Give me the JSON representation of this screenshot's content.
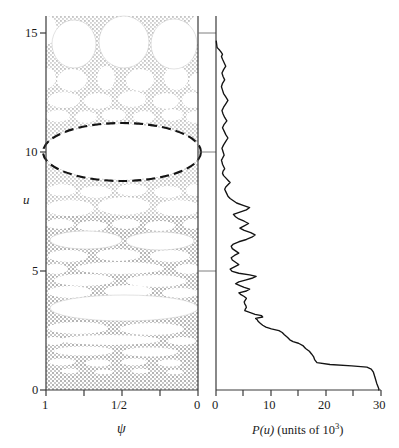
{
  "figure": {
    "name": "phase-space-island-diagram-with-probability-distribution",
    "type": "two-panel-scientific-figure"
  },
  "left_panel": {
    "name": "stability-island-diagram",
    "xlabel": "ψ",
    "ylabel": "u",
    "x_ticks": [
      {
        "value": 1,
        "label": "1"
      },
      {
        "value": 0.75,
        "label": ""
      },
      {
        "value": 0.5,
        "label": "1/2"
      },
      {
        "value": 0.25,
        "label": ""
      },
      {
        "value": 0,
        "label": "0"
      }
    ],
    "y_ticks": [
      {
        "value": 0,
        "label": "0"
      },
      {
        "value": 5,
        "label": "5"
      },
      {
        "value": 10,
        "label": "10"
      },
      {
        "value": 15,
        "label": "15"
      }
    ],
    "xlim": [
      1,
      0
    ],
    "ylim": [
      0,
      16.4
    ],
    "shading": "stippled-gray-chaotic-sea",
    "shade_color": "#bdbdbd",
    "island_color": "#ffffff",
    "highlight": {
      "name": "dashed-ellipse-highlight",
      "center_u": 10.05,
      "center_psi": 0.5,
      "half_width_psi": 0.52,
      "half_height_u": 1.85,
      "style": "dashed",
      "color": "#111111"
    }
  },
  "right_panel": {
    "name": "probability-distribution-plot",
    "xlabel_main": "P(u)",
    "xlabel_units": "(units of 10",
    "xlabel_exp": "3",
    "xlabel_close": ")",
    "x_ticks": [
      {
        "value": 0,
        "label": "0"
      },
      {
        "value": 5,
        "label": ""
      },
      {
        "value": 10,
        "label": "10"
      },
      {
        "value": 15,
        "label": ""
      },
      {
        "value": 20,
        "label": "20"
      },
      {
        "value": 25,
        "label": ""
      },
      {
        "value": 30,
        "label": "30"
      }
    ],
    "xlim": [
      0,
      30.4
    ],
    "ylim": [
      0,
      16.4
    ],
    "curve_color": "#111111",
    "gridline_u_values": [
      5,
      10,
      15
    ]
  },
  "chart_data": {
    "type": "line",
    "title": "",
    "xlabel": "P(u) (units of 10^3)",
    "ylabel": "u",
    "xlim": [
      0,
      30.4
    ],
    "ylim": [
      0,
      16.4
    ],
    "grid": false,
    "orientation": "horizontal-x-is-value-y-is-u",
    "series": [
      {
        "name": "P(u)",
        "u": [
          0.05,
          0.3,
          0.55,
          0.78,
          0.92,
          1.0,
          1.06,
          1.12,
          1.2,
          1.32,
          1.45,
          1.58,
          1.7,
          1.82,
          1.95,
          2.05,
          2.12,
          2.2,
          2.3,
          2.42,
          2.52,
          2.6,
          2.68,
          2.76,
          2.84,
          2.92,
          3.0,
          3.08,
          3.14,
          3.2,
          3.26,
          3.32,
          3.4,
          3.48,
          3.55,
          3.62,
          3.7,
          3.78,
          3.86,
          3.94,
          4.02,
          4.1,
          4.18,
          4.26,
          4.34,
          4.42,
          4.5,
          4.58,
          4.66,
          4.74,
          4.82,
          4.9,
          4.98,
          5.05,
          5.12,
          5.2,
          5.3,
          5.4,
          5.5,
          5.6,
          5.7,
          5.8,
          5.9,
          6.0,
          6.1,
          6.2,
          6.3,
          6.4,
          6.5,
          6.6,
          6.7,
          6.8,
          6.9,
          7.0,
          7.1,
          7.2,
          7.3,
          7.4,
          7.5,
          7.6,
          7.7,
          7.8,
          7.9,
          8.0,
          8.1,
          8.2,
          8.3,
          8.4,
          8.5,
          8.6,
          8.7,
          8.8,
          8.9,
          9.0,
          9.1,
          9.2,
          9.3,
          9.4,
          9.5,
          9.6,
          9.7,
          9.8,
          9.9,
          10.0,
          10.08,
          10.16,
          10.3,
          10.45,
          10.6,
          10.75,
          10.9,
          11.05,
          11.2,
          11.35,
          11.5,
          11.65,
          11.8,
          11.95,
          12.1,
          12.25,
          12.4,
          12.55,
          12.7,
          12.85,
          13.0,
          13.15,
          13.3,
          13.45,
          13.6,
          13.75,
          13.9,
          14.05,
          14.2,
          14.35,
          14.5,
          14.62,
          14.72,
          14.8,
          14.86,
          14.92,
          14.97,
          15.02
        ],
        "P": [
          30.0,
          29.6,
          29.3,
          29.0,
          28.6,
          27.8,
          25.0,
          21.0,
          18.6,
          18.2,
          18.0,
          17.6,
          17.2,
          16.5,
          16.0,
          15.2,
          14.2,
          13.6,
          13.2,
          12.6,
          12.2,
          11.6,
          10.2,
          9.2,
          8.6,
          8.2,
          7.8,
          7.6,
          7.3,
          8.6,
          8.4,
          7.2,
          6.2,
          5.3,
          5.4,
          5.6,
          5.5,
          5.3,
          5.2,
          5.4,
          5.6,
          5.2,
          4.6,
          4.2,
          5.6,
          6.2,
          5.2,
          4.4,
          3.6,
          4.2,
          5.4,
          6.6,
          7.4,
          6.2,
          4.2,
          3.0,
          2.6,
          3.4,
          4.2,
          3.6,
          3.0,
          2.8,
          3.4,
          4.2,
          3.6,
          3.0,
          2.8,
          3.2,
          4.2,
          5.6,
          6.6,
          7.2,
          6.4,
          5.2,
          4.4,
          5.2,
          6.0,
          5.2,
          4.2,
          3.6,
          3.2,
          4.4,
          5.6,
          6.2,
          5.0,
          3.8,
          3.2,
          2.6,
          2.2,
          2.0,
          1.8,
          1.6,
          1.8,
          2.2,
          2.6,
          2.2,
          1.8,
          1.4,
          1.2,
          1.3,
          1.6,
          1.4,
          1.2,
          1.1,
          1.0,
          1.2,
          1.5,
          1.3,
          1.1,
          1.4,
          1.8,
          2.2,
          1.8,
          1.5,
          1.2,
          1.5,
          2.0,
          1.6,
          1.3,
          1.1,
          1.4,
          1.8,
          2.2,
          1.8,
          1.4,
          1.2,
          1.0,
          1.2,
          1.6,
          1.3,
          1.1,
          1.4,
          1.8,
          1.5,
          1.2,
          1.0,
          1.2,
          1.0,
          0.8,
          0.6,
          0.4,
          0.2
        ]
      }
    ],
    "annotations": [
      {
        "text": "dashed ellipse marks large stable island at u ≈ 10",
        "panel": "left"
      }
    ]
  }
}
